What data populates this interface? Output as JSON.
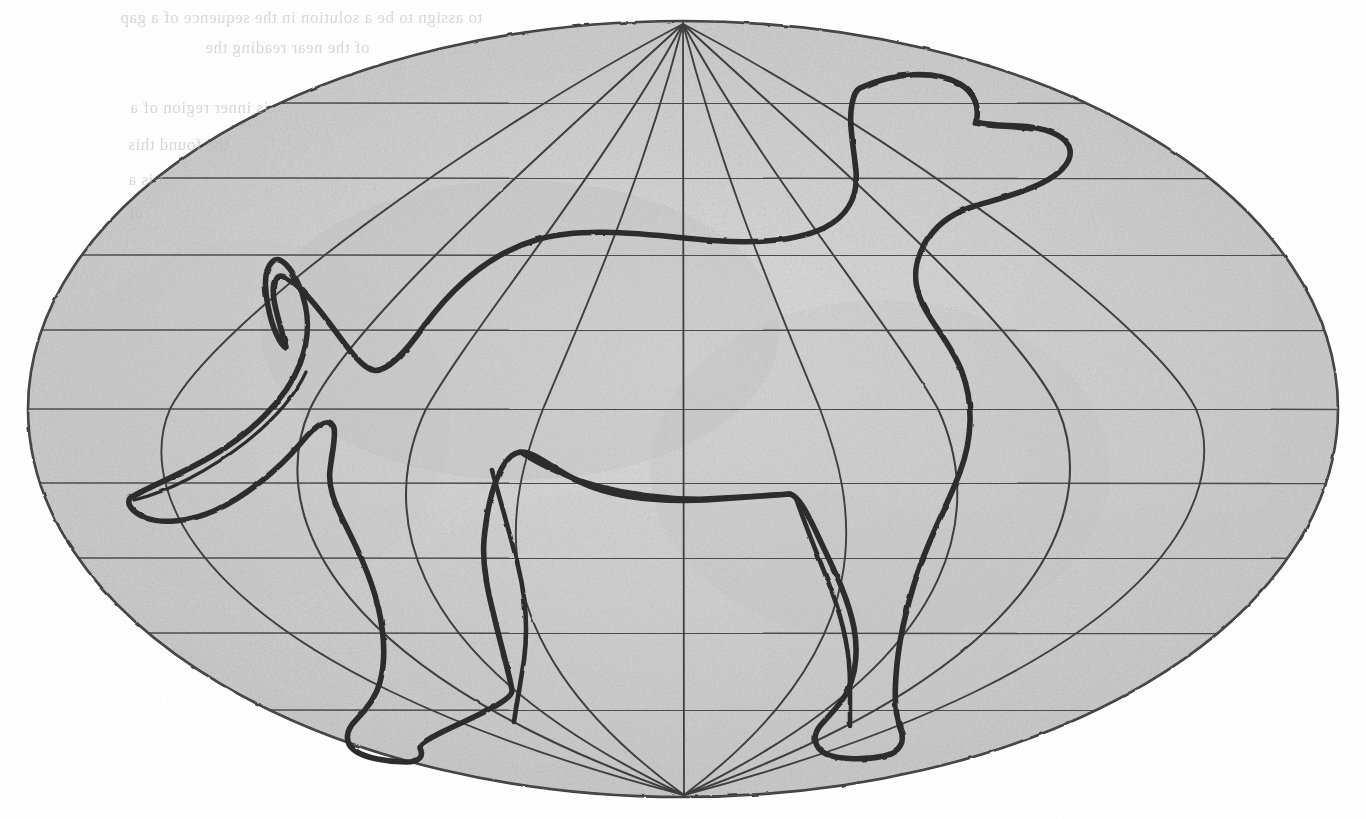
{
  "artwork": {
    "medium": "graphite pencil on paper",
    "title": "Elliptical globe projection with dog silhouette",
    "canvas": {
      "width": 1366,
      "height": 819
    },
    "background_color": "#ffffff",
    "paper_tone": "#fdfdfd"
  },
  "colors": {
    "graphite_dark": "#2b2b2b",
    "graphite_outline": "#3a3a3a",
    "graphite_grid": "#4a4a4a",
    "shade_light": "#e2e2e2",
    "shade_mid": "#cfcfcf",
    "shade_dark": "#bdbdbd",
    "ghost_text": "#b9b9bb"
  },
  "globe": {
    "label": "elliptical map projection",
    "center_x": 683,
    "center_y": 409,
    "radius_x": 655,
    "radius_y": 388,
    "north_pole": {
      "x": 683,
      "y": 22
    },
    "south_pole": {
      "x": 684,
      "y": 797
    },
    "outline_stroke_width": 2.4,
    "grid_on": true,
    "parallels_label": "latitude lines",
    "parallels_y": [
      103,
      178,
      255,
      330,
      409,
      483,
      558,
      633,
      710
    ],
    "meridians_label": "longitude meridians",
    "meridian_equator_x": [
      170,
      310,
      426,
      543,
      683,
      820,
      938,
      1058,
      1196
    ],
    "meridian_count": 9
  },
  "dog": {
    "label": "dog silhouette outline",
    "stroke_color": "#2b2b2b",
    "stroke_width": 5.5,
    "description": "standing dog in profile facing right, drawn in outline over the globe",
    "parts": [
      "head",
      "muzzle",
      "ear",
      "neck",
      "back",
      "tail",
      "hind-leg",
      "front-leg",
      "belly",
      "paws"
    ]
  },
  "ghost_text": {
    "note": "faint mirrored show-through text from the reverse of the sheet",
    "lines": [
      {
        "text": "to assign to be a solution in the sequence of a gap",
        "x": 120,
        "y": 8,
        "size": 17
      },
      {
        "text": "of the near reading the",
        "x": 205,
        "y": 38,
        "size": 17
      },
      {
        "text": "is inner region of a",
        "x": 130,
        "y": 98,
        "size": 17
      },
      {
        "text": "the found this",
        "x": 128,
        "y": 135,
        "size": 17
      },
      {
        "text": "t is a",
        "x": 128,
        "y": 170,
        "size": 17
      },
      {
        "text": "of",
        "x": 128,
        "y": 203,
        "size": 17
      }
    ]
  }
}
